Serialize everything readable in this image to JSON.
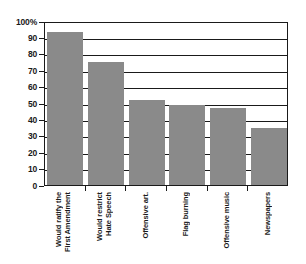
{
  "chart_data": {
    "type": "bar",
    "title": "",
    "subtitle": "",
    "xlabel": "",
    "ylabel": "",
    "ylim": [
      0,
      100
    ],
    "grid": true,
    "legend": false,
    "legend_position": "none",
    "bar_color": "#8a8a8a",
    "axis_color": "#1a1a1a",
    "y_ticks": [
      "0",
      "10",
      "20",
      "30",
      "40",
      "50",
      "60",
      "70",
      "80",
      "90",
      "100%"
    ],
    "y_tick_values": [
      0,
      10,
      20,
      30,
      40,
      50,
      60,
      70,
      80,
      90,
      100
    ],
    "categories": [
      "Would ratify the\nFirst Amendment",
      "Would restrict\nHate Speech",
      "Offensive art.",
      "Flag burning",
      "Offensive music",
      "Newspapers"
    ],
    "category_lines": [
      [
        "Would ratify the",
        "First Amendment"
      ],
      [
        "Would restrict",
        "Hate Speech"
      ],
      [
        "Offensive art."
      ],
      [
        "Flag burning"
      ],
      [
        "Offensive music"
      ],
      [
        "Newspapers"
      ]
    ],
    "values": [
      93,
      75,
      52,
      49,
      47,
      35
    ]
  }
}
